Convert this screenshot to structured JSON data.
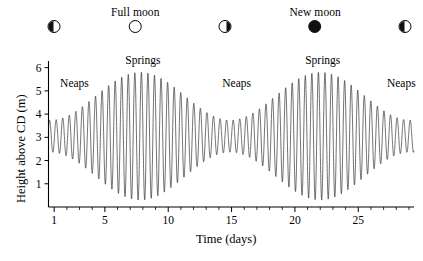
{
  "figure": {
    "background_color": "#ffffff",
    "line_color": "#1a1a1a"
  },
  "moon_phases": [
    {
      "name": "first-quarter-left",
      "label": "",
      "glyph": "half-left",
      "x_day": 1.0
    },
    {
      "name": "full-moon",
      "label": "Full moon",
      "glyph": "full",
      "x_day": 7.4
    },
    {
      "name": "last-quarter",
      "label": "",
      "glyph": "half-right",
      "x_day": 14.5
    },
    {
      "name": "new-moon",
      "label": "New moon",
      "glyph": "new",
      "x_day": 21.6
    },
    {
      "name": "first-quarter-right",
      "label": "",
      "glyph": "half-left",
      "x_day": 28.7
    }
  ],
  "annotations": [
    {
      "name": "neaps-left",
      "text": "Neaps",
      "x_day": 2.6,
      "y_m": 5.35
    },
    {
      "name": "springs-left",
      "text": "Springs",
      "x_day": 8.0,
      "y_m": 6.35
    },
    {
      "name": "neaps-mid",
      "text": "Neaps",
      "x_day": 15.4,
      "y_m": 5.35
    },
    {
      "name": "springs-right",
      "text": "Springs",
      "x_day": 22.2,
      "y_m": 6.35
    },
    {
      "name": "neaps-right",
      "text": "Neaps",
      "x_day": 28.4,
      "y_m": 5.35
    }
  ],
  "chart_data": {
    "type": "line",
    "title": "",
    "xlabel": "Time (days)",
    "ylabel": "Height above CD (m)",
    "xlim": [
      0.55,
      29.4
    ],
    "ylim": [
      0.0,
      6.2
    ],
    "xticks": [
      1,
      5,
      10,
      15,
      20,
      25
    ],
    "xtick_labels": [
      "1",
      "5",
      "10",
      "15",
      "20",
      "25"
    ],
    "xminor_step": 1,
    "yticks": [
      1,
      2,
      3,
      4,
      5,
      6
    ],
    "ytick_labels": [
      "1",
      "2",
      "3",
      "4",
      "5",
      "6"
    ],
    "grid": false,
    "legend": null,
    "series": [
      {
        "name": "tidal-height",
        "description": "Semidiurnal tide height above Chart Datum with spring-neap modulation",
        "model": {
          "mean_level_m": 3.05,
          "semidiurnal_period_days": 0.5175,
          "semidiurnal_phase_days": 0.12,
          "spring_neap_period_days": 14.2,
          "spring_neap_phase_days": 7.8,
          "amplitude_mean_m": 1.72,
          "amplitude_modulation_m": 1.03
        },
        "sampled_points_day_height": [
          [
            1.0,
            2.05
          ],
          [
            1.25,
            4.25
          ],
          [
            1.5,
            2.15
          ],
          [
            1.75,
            4.3
          ],
          [
            2.0,
            2.1
          ],
          [
            2.25,
            4.3
          ],
          [
            2.5,
            2.05
          ],
          [
            2.75,
            4.35
          ],
          [
            3.0,
            2.0
          ],
          [
            3.25,
            4.4
          ],
          [
            3.5,
            1.95
          ],
          [
            3.75,
            4.45
          ],
          [
            4.0,
            1.85
          ],
          [
            4.25,
            4.55
          ],
          [
            4.5,
            1.75
          ],
          [
            4.75,
            4.65
          ],
          [
            5.0,
            1.6
          ],
          [
            5.25,
            4.8
          ],
          [
            5.5,
            1.45
          ],
          [
            5.75,
            4.95
          ],
          [
            6.0,
            1.25
          ],
          [
            6.25,
            5.15
          ],
          [
            6.5,
            1.05
          ],
          [
            6.75,
            5.35
          ],
          [
            7.0,
            0.8
          ],
          [
            7.25,
            5.55
          ],
          [
            7.5,
            0.6
          ],
          [
            7.75,
            5.7
          ],
          [
            8.0,
            0.45
          ],
          [
            8.25,
            5.8
          ],
          [
            8.5,
            0.35
          ],
          [
            8.75,
            5.8
          ],
          [
            9.0,
            0.4
          ],
          [
            9.25,
            5.75
          ],
          [
            9.5,
            0.55
          ],
          [
            9.75,
            5.6
          ],
          [
            10.0,
            0.75
          ],
          [
            10.25,
            5.4
          ],
          [
            10.5,
            1.0
          ],
          [
            10.75,
            5.2
          ],
          [
            11.0,
            1.25
          ],
          [
            11.25,
            4.95
          ],
          [
            11.5,
            1.5
          ],
          [
            11.75,
            4.7
          ],
          [
            12.0,
            1.75
          ],
          [
            12.25,
            4.45
          ],
          [
            12.5,
            2.0
          ],
          [
            12.75,
            4.2
          ],
          [
            13.0,
            2.2
          ],
          [
            13.25,
            4.0
          ],
          [
            13.5,
            2.4
          ],
          [
            13.75,
            3.85
          ],
          [
            14.0,
            2.55
          ],
          [
            14.25,
            3.7
          ],
          [
            14.5,
            2.65
          ],
          [
            14.75,
            3.6
          ],
          [
            15.0,
            2.7
          ],
          [
            15.25,
            3.5
          ],
          [
            15.5,
            2.75
          ],
          [
            15.75,
            3.5
          ],
          [
            16.0,
            2.7
          ],
          [
            16.25,
            3.55
          ],
          [
            16.5,
            2.6
          ],
          [
            16.75,
            3.65
          ],
          [
            17.0,
            2.45
          ],
          [
            17.25,
            3.8
          ],
          [
            17.5,
            2.3
          ],
          [
            17.75,
            4.0
          ],
          [
            18.0,
            2.1
          ],
          [
            18.25,
            4.2
          ],
          [
            18.5,
            1.85
          ],
          [
            18.75,
            4.45
          ],
          [
            19.0,
            1.6
          ],
          [
            19.25,
            4.7
          ],
          [
            19.5,
            1.35
          ],
          [
            19.75,
            4.95
          ],
          [
            20.0,
            1.1
          ],
          [
            20.25,
            5.2
          ],
          [
            20.5,
            0.9
          ],
          [
            20.75,
            5.4
          ],
          [
            21.0,
            0.7
          ],
          [
            21.25,
            5.55
          ],
          [
            21.5,
            0.55
          ],
          [
            21.75,
            5.7
          ],
          [
            22.0,
            0.45
          ],
          [
            22.25,
            5.75
          ],
          [
            22.5,
            0.45
          ],
          [
            22.75,
            5.75
          ],
          [
            23.0,
            0.5
          ],
          [
            23.25,
            5.7
          ],
          [
            23.5,
            0.6
          ],
          [
            23.75,
            5.6
          ],
          [
            24.0,
            0.75
          ],
          [
            24.25,
            5.45
          ],
          [
            24.5,
            0.95
          ],
          [
            24.75,
            5.3
          ],
          [
            25.0,
            1.15
          ],
          [
            25.25,
            5.1
          ],
          [
            25.5,
            1.4
          ],
          [
            25.75,
            4.85
          ],
          [
            26.0,
            1.6
          ],
          [
            26.25,
            4.65
          ],
          [
            26.5,
            1.8
          ],
          [
            26.75,
            4.45
          ],
          [
            27.0,
            2.0
          ],
          [
            27.25,
            4.3
          ],
          [
            27.5,
            2.15
          ],
          [
            27.75,
            4.15
          ],
          [
            28.0,
            2.3
          ],
          [
            28.25,
            4.05
          ],
          [
            28.5,
            2.4
          ],
          [
            28.75,
            3.95
          ],
          [
            29.0,
            2.5
          ],
          [
            29.2,
            3.9
          ]
        ]
      }
    ]
  }
}
